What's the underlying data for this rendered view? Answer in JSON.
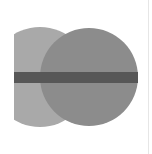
{
  "canvas": {
    "width": 152,
    "height": 154,
    "background": "#ffffff"
  },
  "shapes": {
    "left_half_disc": {
      "cx": 40,
      "cy": 77,
      "r": 50,
      "clip_x": 14,
      "color": "#a9a9a9"
    },
    "right_circle": {
      "cx": 89,
      "cy": 77,
      "r": 49,
      "color": "#8c8c8c"
    },
    "horizontal_bar": {
      "x": 14,
      "y": 72,
      "width": 124,
      "height": 11,
      "color": "#575757"
    }
  },
  "edge_line": {
    "x": 148,
    "color": "#e6e6e6"
  }
}
